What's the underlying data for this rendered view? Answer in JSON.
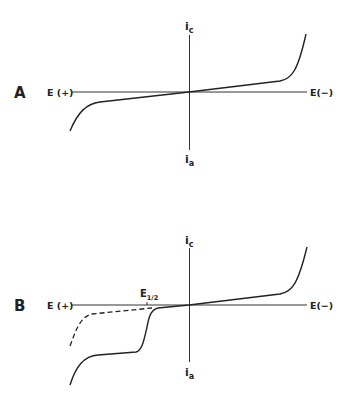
{
  "figure": {
    "background": "#ffffff",
    "ink": "#222222",
    "panels": [
      {
        "id": "A",
        "label": "A",
        "x_axis_left_label": "E (+)",
        "x_axis_right_label": "E(−)",
        "y_axis_top_label": "i",
        "y_axis_top_sub": "c",
        "y_axis_bottom_label": "i",
        "y_axis_bottom_sub": "a",
        "curves": [
          {
            "name": "background current",
            "style": "solid",
            "path": "M70,131 C78,112 86,104 100,102 L189,92 L280,81 C292,79 298,70 306,34"
          }
        ]
      },
      {
        "id": "B",
        "label": "B",
        "x_axis_left_label": "E (+)",
        "x_axis_right_label": "E(−)",
        "y_axis_top_label": "i",
        "y_axis_top_sub": "c",
        "y_axis_bottom_label": "i",
        "y_axis_bottom_sub": "a",
        "half_wave_label": "E",
        "half_wave_sub": "1/2",
        "curves": [
          {
            "name": "anodic wave",
            "style": "solid",
            "path": "M70,385 C76,366 84,356 98,355 L136,352 C142,351 144,340 147,327 C149,316 151,310 158,308 L189,305 L280,294 C292,292 298,284 307,247"
          },
          {
            "name": "background current",
            "style": "dashed",
            "path": "M70,346 C76,330 80,317 92,314 L152,308"
          }
        ]
      }
    ]
  }
}
